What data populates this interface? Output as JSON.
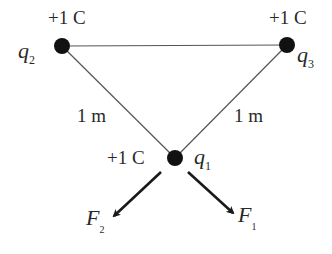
{
  "figure": {
    "charges": [
      {
        "id": "q1",
        "symbol": "q",
        "subscript": "1",
        "charge_label": "+1 C",
        "x": 175,
        "y": 158
      },
      {
        "id": "q2",
        "symbol": "q",
        "subscript": "2",
        "charge_label": "+1 C",
        "x": 62,
        "y": 46
      },
      {
        "id": "q3",
        "symbol": "q",
        "subscript": "3",
        "charge_label": "+1 C",
        "x": 287,
        "y": 45
      }
    ],
    "distances": [
      {
        "between": "q2-q1",
        "label": "1 m"
      },
      {
        "between": "q3-q1",
        "label": "1 m"
      }
    ],
    "forces": [
      {
        "id": "F1",
        "symbol": "F",
        "subscript": "1",
        "on": "q1"
      },
      {
        "id": "F2",
        "symbol": "F",
        "subscript": "2",
        "on": "q1"
      }
    ],
    "colors": {
      "ink": "#1a1a1a",
      "line": "#555555",
      "background": "#ffffff"
    }
  }
}
